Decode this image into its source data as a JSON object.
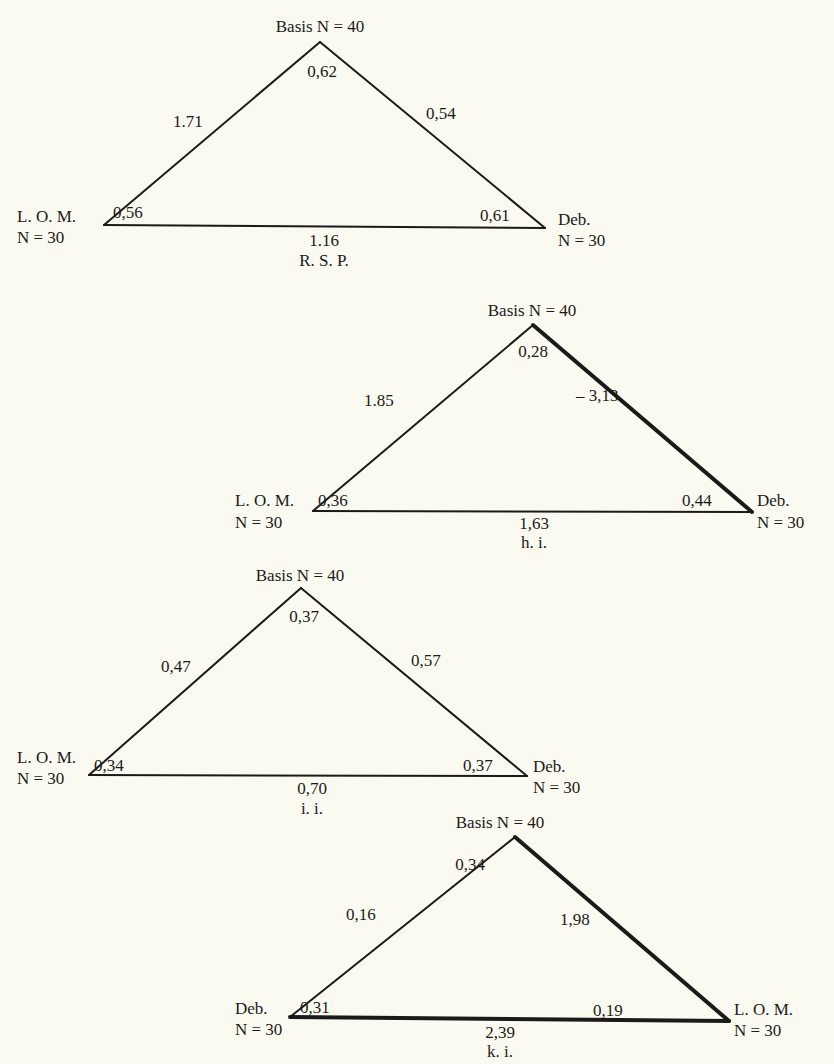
{
  "colors": {
    "background": "#fbfaf1",
    "ink": "#1a1a1a"
  },
  "triangles": [
    {
      "caption": "R. S. P.",
      "apex": {
        "label": "Basis N = 40",
        "x": 320,
        "y": 42,
        "angle": "0,62"
      },
      "left": {
        "name": "L. O. M.",
        "n": "N = 30",
        "x": 104,
        "y": 225,
        "angle": "0,56"
      },
      "right": {
        "name": "Deb.",
        "n": "N = 30",
        "x": 545,
        "y": 228,
        "angle": "0,61"
      },
      "edges": {
        "left": "1.71",
        "right": "0,54",
        "base": "1.16"
      },
      "thick": {
        "left": false,
        "right": false,
        "base": false
      }
    },
    {
      "caption": "h. i.",
      "apex": {
        "label": "Basis N = 40",
        "x": 533,
        "y": 325,
        "angle": "0,28"
      },
      "left": {
        "name": "L. O. M.",
        "n": "N = 30",
        "x": 313,
        "y": 511,
        "angle": "0,36"
      },
      "right": {
        "name": "Deb.",
        "n": "N = 30",
        "x": 752,
        "y": 512,
        "angle": "0,44"
      },
      "edges": {
        "left": "1.85",
        "right": "– 3,13",
        "base": "1,63"
      },
      "thick": {
        "left": false,
        "right": true,
        "base": false
      }
    },
    {
      "caption": "i. i.",
      "apex": {
        "label": "Basis N = 40",
        "x": 301,
        "y": 588,
        "angle": "0,37"
      },
      "left": {
        "name": "L. O. M.",
        "n": "N = 30",
        "x": 89,
        "y": 775,
        "angle": "0,34"
      },
      "right": {
        "name": "Deb.",
        "n": "N = 30",
        "x": 527,
        "y": 776,
        "angle": "0,37"
      },
      "edges": {
        "left": "0,47",
        "right": "0,57",
        "base": "0,70"
      },
      "thick": {
        "left": false,
        "right": false,
        "base": false
      }
    },
    {
      "caption": "k. i.",
      "apex": {
        "label": "Basis N = 40",
        "x": 515,
        "y": 837,
        "angle": "0,34"
      },
      "left": {
        "name": "Deb.",
        "n": "N = 30",
        "x": 290,
        "y": 1017,
        "angle": "0,31"
      },
      "right": {
        "name": "L. O. M.",
        "n": "N = 30",
        "x": 729,
        "y": 1021,
        "angle": "0,19"
      },
      "edges": {
        "left": "0,16",
        "right": "1,98",
        "base": "2,39"
      },
      "thick": {
        "left": false,
        "right": true,
        "base": true
      }
    }
  ]
}
